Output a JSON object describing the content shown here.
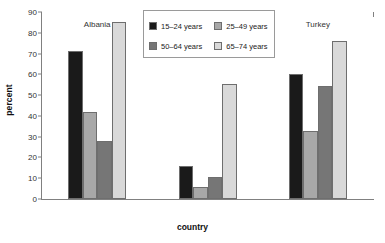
{
  "chart_data": {
    "type": "bar",
    "title": "",
    "subtitle": "",
    "xlabel": "country",
    "ylabel": "percent",
    "categories": [
      "Albania",
      "Bulgaria",
      "Turkey"
    ],
    "series": [
      {
        "name": "15–24 years",
        "color": "#1a1a1a",
        "values": [
          71,
          16,
          60
        ]
      },
      {
        "name": "25–49 years",
        "color": "#a8a8a8",
        "values": [
          42,
          6,
          32.5
        ]
      },
      {
        "name": "50–64 years",
        "color": "#767676",
        "values": [
          28,
          10.5,
          54.5
        ]
      },
      {
        "name": "65–74 years",
        "color": "#d9d9d9",
        "values": [
          85,
          55.5,
          76
        ]
      }
    ],
    "ylim": [
      0,
      90
    ],
    "yticks": [
      0,
      10,
      20,
      30,
      40,
      50,
      60,
      70,
      80,
      90
    ],
    "ytick_labels": [
      "0",
      "10",
      "20",
      "30",
      "40",
      "50",
      "60",
      "70",
      "80",
      "90"
    ],
    "grid": false,
    "legend_position": "top-right",
    "axis_color": "#808080",
    "bar_border_color": "#6e6e6e"
  }
}
